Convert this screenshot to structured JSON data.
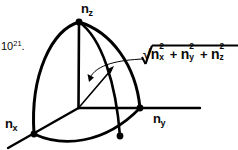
{
  "figure": {
    "name": "octant-sphere-n-space-diagram",
    "line_color": "#000000",
    "background_color": "#ffffff",
    "axes": [
      {
        "id": "nz",
        "label_base": "n",
        "label_sub": "z",
        "direction": "up"
      },
      {
        "id": "ny",
        "label_base": "n",
        "label_sub": "y",
        "direction": "right"
      },
      {
        "id": "nx",
        "label_base": "n",
        "label_sub": "x",
        "direction": "lower-left"
      }
    ],
    "annotation": {
      "name": "radius-magnitude",
      "radical_symbol": "√",
      "terms": [
        {
          "base": "n",
          "sub": "x",
          "sup": "2"
        },
        {
          "base": "n",
          "sub": "y",
          "sup": "2"
        },
        {
          "base": "n",
          "sub": "z",
          "sup": "2"
        }
      ],
      "operators": [
        "+",
        "+"
      ],
      "plain_text": "sqrt(n_x^2 + n_y^2 + n_z^2)"
    },
    "page_fragment": {
      "base": "10",
      "sup": "21",
      "trailing": "."
    },
    "markers": [
      {
        "name": "apex-dot",
        "x": 79,
        "y": 22
      },
      {
        "name": "nx-axis-dot",
        "x": 34,
        "y": 134
      },
      {
        "name": "ny-axis-dot",
        "x": 140,
        "y": 108
      },
      {
        "name": "front-arc-dot",
        "x": 120,
        "y": 136
      },
      {
        "name": "origin",
        "x": 78,
        "y": 108
      }
    ],
    "vector": {
      "name": "radius-vector",
      "from": [
        78,
        108
      ],
      "to": [
        114,
        67
      ],
      "has_arrowhead": true
    },
    "leader": {
      "name": "annotation-leader-line",
      "from": [
        140,
        62
      ],
      "to": [
        92,
        79
      ],
      "has_arrowhead": true,
      "curved": true
    }
  }
}
